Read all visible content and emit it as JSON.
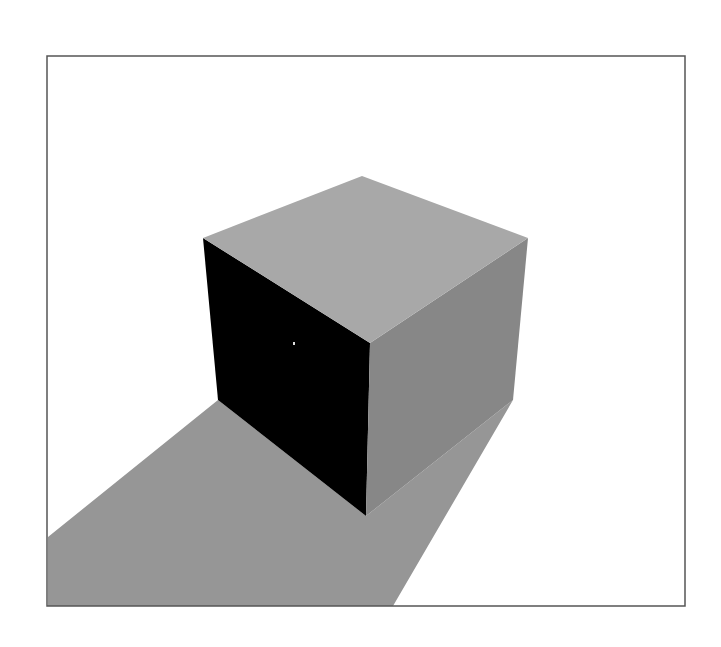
{
  "scene": {
    "title": "Rendered cube with cast shadow",
    "background": "#ffffff",
    "frame": {
      "x": 47,
      "y": 56,
      "width": 638,
      "height": 550,
      "stroke": "#555555",
      "stroke_width": 1.5
    },
    "shadow": {
      "color": "#969696",
      "points": "218,400 366,516 513,400 393,606 48,606 48,537"
    },
    "cube": {
      "top_face": {
        "color": "#a8a8a8",
        "points": "203,238 362,176 528,238 370,343"
      },
      "left_face": {
        "color": "#000000",
        "points": "203,238 370,343 366,516 218,400"
      },
      "right_face": {
        "color": "#878787",
        "points": "370,343 528,238 513,400 366,516"
      }
    },
    "highlight_speck": {
      "x": 293,
      "y": 342,
      "color": "#dddddd"
    }
  }
}
